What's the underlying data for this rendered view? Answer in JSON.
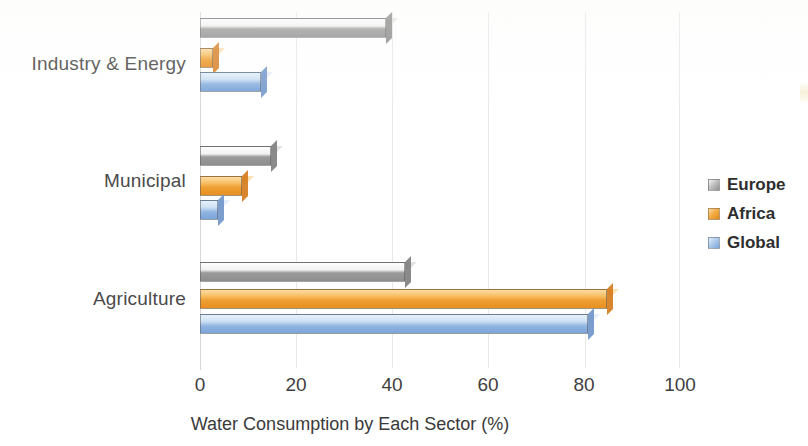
{
  "chart_data": {
    "type": "bar",
    "orientation": "horizontal",
    "title": "",
    "xlabel": "Water Consumption by Each Sector (%)",
    "ylabel": "",
    "categories": [
      "Agriculture",
      "Municipal",
      "Industry & Energy"
    ],
    "series": [
      {
        "name": "Europe",
        "color": "#9a9a9a",
        "values": [
          44,
          16,
          40
        ]
      },
      {
        "name": "Africa",
        "color": "#ef9f32",
        "values": [
          86,
          10,
          4
        ]
      },
      {
        "name": "Global",
        "color": "#8fb4e0",
        "values": [
          82,
          5,
          14
        ]
      }
    ],
    "xlim": [
      0,
      100
    ],
    "xticks": [
      0,
      20,
      40,
      60,
      80,
      100
    ],
    "xtick_labels": [
      "0",
      "20",
      "40",
      "60",
      "80",
      "100"
    ],
    "grid": true,
    "grid_axis": "x",
    "legend_position": "right",
    "style": "3d-shaded-bars"
  },
  "axis": {
    "x_title": "Water Consumption by Each Sector (%)",
    "ticks": [
      {
        "label": "0",
        "value": 0
      },
      {
        "label": "20",
        "value": 20
      },
      {
        "label": "40",
        "value": 40
      },
      {
        "label": "60",
        "value": 60
      },
      {
        "label": "80",
        "value": 80
      },
      {
        "label": "100",
        "value": 100
      }
    ],
    "categories": [
      {
        "label": "Industry & Energy"
      },
      {
        "label": "Municipal"
      },
      {
        "label": "Agriculture"
      }
    ]
  },
  "legend": {
    "items": [
      {
        "label": "Europe",
        "swatch": "europe-swatch"
      },
      {
        "label": "Africa",
        "swatch": "africa-swatch"
      },
      {
        "label": "Global",
        "swatch": "global-swatch"
      }
    ]
  },
  "bars": [
    {
      "group": "Industry & Energy",
      "series": "Europe",
      "value": 40,
      "cls": "c-europe",
      "top": 18
    },
    {
      "group": "Industry & Energy",
      "series": "Africa",
      "value": 4,
      "cls": "c-africa",
      "top": 48
    },
    {
      "group": "Industry & Energy",
      "series": "Global",
      "value": 14,
      "cls": "c-global",
      "top": 72
    },
    {
      "group": "Municipal",
      "series": "Europe",
      "value": 16,
      "cls": "c-europe",
      "top": 146
    },
    {
      "group": "Municipal",
      "series": "Africa",
      "value": 10,
      "cls": "c-africa",
      "top": 176
    },
    {
      "group": "Municipal",
      "series": "Global",
      "value": 5,
      "cls": "c-global",
      "top": 200
    },
    {
      "group": "Agriculture",
      "series": "Europe",
      "value": 44,
      "cls": "c-europe",
      "top": 262
    },
    {
      "group": "Agriculture",
      "series": "Africa",
      "value": 86,
      "cls": "c-africa",
      "top": 289
    },
    {
      "group": "Agriculture",
      "series": "Global",
      "value": 82,
      "cls": "c-global",
      "top": 314
    }
  ],
  "category_label_positions": [
    {
      "label": "Industry & Energy",
      "top": 53
    },
    {
      "label": "Municipal",
      "top": 170
    },
    {
      "label": "Agriculture",
      "top": 288
    }
  ]
}
